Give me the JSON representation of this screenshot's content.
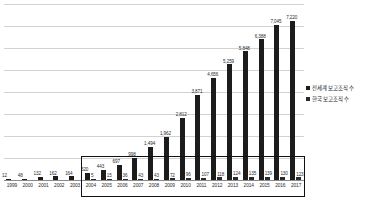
{
  "chart_data": {
    "type": "bar",
    "title": "",
    "subtitle": "",
    "xlabel": "",
    "ylabel": "",
    "grid": true,
    "legend_position": "right",
    "ylim": [
      0,
      8000
    ],
    "gridline_count": 8,
    "categories": [
      "1999",
      "2000",
      "2001",
      "2002",
      "2003",
      "2004",
      "2005",
      "2006",
      "2007",
      "2008",
      "2009",
      "2010",
      "2011",
      "2012",
      "2013",
      "2014",
      "2015",
      "2016",
      "2017"
    ],
    "series": [
      {
        "name": "전세계 보고조직 수",
        "color": "#1c1c1c",
        "values": [
          12,
          48,
          132,
          162,
          164,
          320,
          443,
          697,
          998,
          1494,
          1962,
          2812,
          3871,
          4656,
          5259,
          5848,
          6388,
          7045,
          7220
        ],
        "labels": [
          "12",
          "48",
          "132",
          "162",
          "164",
          "320",
          "443",
          "697",
          "998",
          "1,494",
          "1,962",
          "2,812",
          "3,871",
          "4,656",
          "5,259",
          "5,848",
          "6,388",
          "7,045",
          "7,220"
        ]
      },
      {
        "name": "한국 보고조직 수",
        "color": "#2a2a2a",
        "values": [
          null,
          null,
          null,
          null,
          null,
          5,
          15,
          36,
          43,
          43,
          72,
          96,
          107,
          118,
          124,
          135,
          139,
          130,
          123
        ],
        "labels": [
          "",
          "",
          "",
          "",
          "",
          "5",
          "15",
          "36",
          "43",
          "43",
          "72",
          "96",
          "107",
          "118",
          "124",
          "135",
          "139",
          "130",
          "123"
        ]
      }
    ],
    "annotations": [
      {
        "name": "highlight-box",
        "type": "rectangle",
        "from_category": "2004",
        "to_category": "2017",
        "description": "black rectangle outlining 2004 through 2017 data labels and axis"
      }
    ]
  },
  "legend": {
    "items": [
      {
        "label": "전세계 보고조직 수",
        "color": "#1c1c1c"
      },
      {
        "label": "한국 보고조직 수",
        "color": "#2a2a2a"
      }
    ]
  }
}
